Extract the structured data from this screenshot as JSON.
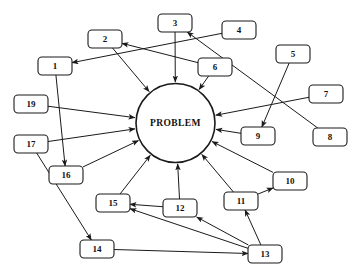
{
  "diagram": {
    "type": "fishbone-style cause and effect / spider diagram",
    "center": {
      "label": "PROBLEM",
      "cx": 175.5,
      "cy": 123,
      "r": 39.5
    },
    "box_size": {
      "w": 34,
      "h": 18,
      "rx": 4
    },
    "nodes": [
      {
        "id": "1",
        "label": "1",
        "x": 38,
        "y": 57
      },
      {
        "id": "2",
        "label": "2",
        "x": 88,
        "y": 30
      },
      {
        "id": "3",
        "label": "3",
        "x": 158,
        "y": 14
      },
      {
        "id": "4",
        "label": "4",
        "x": 222,
        "y": 21
      },
      {
        "id": "5",
        "label": "5",
        "x": 276,
        "y": 45
      },
      {
        "id": "6",
        "label": "6",
        "x": 198,
        "y": 58
      },
      {
        "id": "7",
        "label": "7",
        "x": 309,
        "y": 85
      },
      {
        "id": "8",
        "label": "8",
        "x": 313,
        "y": 128
      },
      {
        "id": "9",
        "label": "9",
        "x": 241,
        "y": 127
      },
      {
        "id": "10",
        "label": "10",
        "x": 273,
        "y": 172
      },
      {
        "id": "11",
        "label": "11",
        "x": 224,
        "y": 192
      },
      {
        "id": "12",
        "label": "12",
        "x": 163,
        "y": 199
      },
      {
        "id": "13",
        "label": "13",
        "x": 248,
        "y": 245
      },
      {
        "id": "14",
        "label": "14",
        "x": 80,
        "y": 240
      },
      {
        "id": "15",
        "label": "15",
        "x": 96,
        "y": 194
      },
      {
        "id": "16",
        "label": "16",
        "x": 49,
        "y": 166
      },
      {
        "id": "17",
        "label": "17",
        "x": 14,
        "y": 135
      },
      {
        "id": "19",
        "label": "19",
        "x": 14,
        "y": 95
      }
    ],
    "edges": [
      {
        "from": "2",
        "to": "center",
        "kind": "to-center"
      },
      {
        "from": "3",
        "to": "center",
        "kind": "to-center"
      },
      {
        "from": "6",
        "to": "center",
        "kind": "to-center"
      },
      {
        "from": "7",
        "to": "center",
        "kind": "to-center"
      },
      {
        "from": "9",
        "to": "center",
        "kind": "to-center"
      },
      {
        "from": "10",
        "to": "center",
        "kind": "to-center"
      },
      {
        "from": "11",
        "to": "center",
        "kind": "to-center"
      },
      {
        "from": "12",
        "to": "center",
        "kind": "to-center"
      },
      {
        "from": "15",
        "to": "center",
        "kind": "to-center"
      },
      {
        "from": "16",
        "to": "center",
        "kind": "to-center"
      },
      {
        "from": "17",
        "to": "center",
        "kind": "to-center"
      },
      {
        "from": "19",
        "to": "center",
        "kind": "to-center"
      },
      {
        "from": "6",
        "to": "2",
        "kind": "node-to-node"
      },
      {
        "from": "4",
        "to": "1",
        "kind": "node-to-node"
      },
      {
        "from": "8",
        "to": "3",
        "kind": "node-to-node"
      },
      {
        "from": "5",
        "to": "9",
        "kind": "node-to-node"
      },
      {
        "from": "1",
        "to": "16",
        "kind": "node-to-node"
      },
      {
        "from": "17",
        "to": "14",
        "kind": "node-to-node"
      },
      {
        "from": "14",
        "to": "13",
        "kind": "node-to-node"
      },
      {
        "from": "13",
        "to": "12",
        "kind": "node-to-node"
      },
      {
        "from": "13",
        "to": "15",
        "kind": "node-to-node"
      },
      {
        "from": "12",
        "to": "15",
        "kind": "node-to-node"
      },
      {
        "from": "13",
        "to": "11",
        "kind": "node-to-node"
      },
      {
        "from": "11",
        "to": "10",
        "kind": "node-to-node"
      }
    ],
    "colors": {
      "stroke": "#1a1a1a",
      "fill": "#ffffff",
      "background": "#ffffff",
      "text": "#111111"
    }
  }
}
